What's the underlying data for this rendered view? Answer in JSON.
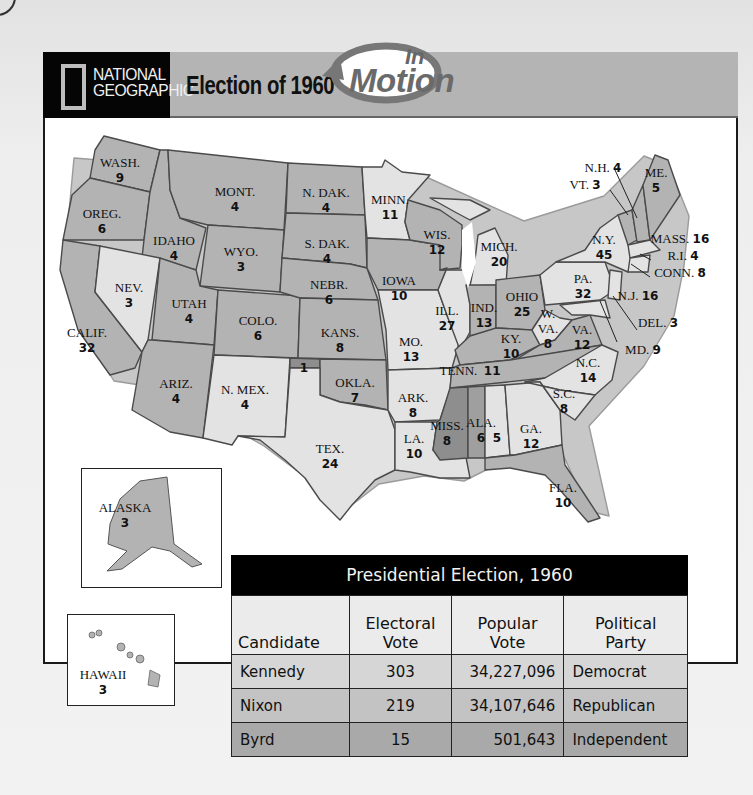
{
  "header": {
    "brand_line1": "NATIONAL",
    "brand_line2": "GEOGRAPHIC",
    "title": "Election of 1960",
    "badge_small": "In",
    "badge_large": "Motion"
  },
  "map": {
    "legend_colors": {
      "kennedy_democrat": "#e3e3e3",
      "nixon_republican": "#b3b3b3",
      "byrd_independent": "#8e8e8e",
      "split_kennedy": "#b7b7b7"
    },
    "states": [
      {
        "abbr": "WASH.",
        "votes": "9"
      },
      {
        "abbr": "OREG.",
        "votes": "6"
      },
      {
        "abbr": "CALIF.",
        "votes": "32"
      },
      {
        "abbr": "IDAHO",
        "votes": "4"
      },
      {
        "abbr": "NEV.",
        "votes": "3"
      },
      {
        "abbr": "MONT.",
        "votes": "4"
      },
      {
        "abbr": "WYO.",
        "votes": "3"
      },
      {
        "abbr": "UTAH",
        "votes": "4"
      },
      {
        "abbr": "COLO.",
        "votes": "6"
      },
      {
        "abbr": "ARIZ.",
        "votes": "4"
      },
      {
        "abbr": "N. MEX.",
        "votes": "4"
      },
      {
        "abbr": "N. DAK.",
        "votes": "4"
      },
      {
        "abbr": "S. DAK.",
        "votes": "4"
      },
      {
        "abbr": "NEBR.",
        "votes": "6"
      },
      {
        "abbr": "KANS.",
        "votes": "8"
      },
      {
        "abbr": "OKLA.",
        "votes": "7"
      },
      {
        "abbr": "TEX.",
        "votes": "24"
      },
      {
        "abbr": "MINN.",
        "votes": "11"
      },
      {
        "abbr": "IOWA",
        "votes": "10"
      },
      {
        "abbr": "MO.",
        "votes": "13"
      },
      {
        "abbr": "ARK.",
        "votes": "8"
      },
      {
        "abbr": "LA.",
        "votes": "10"
      },
      {
        "abbr": "WIS.",
        "votes": "12"
      },
      {
        "abbr": "ILL.",
        "votes": "27"
      },
      {
        "abbr": "MICH.",
        "votes": "20"
      },
      {
        "abbr": "IND.",
        "votes": "13"
      },
      {
        "abbr": "OHIO",
        "votes": "25"
      },
      {
        "abbr": "KY.",
        "votes": "10"
      },
      {
        "abbr": "TENN.",
        "votes": "11"
      },
      {
        "abbr": "MISS.",
        "votes": "8"
      },
      {
        "abbr": "ALA.",
        "votes": "6"
      },
      {
        "abbr": "ALA.",
        "votes": "5"
      },
      {
        "abbr": "GA.",
        "votes": "12"
      },
      {
        "abbr": "FLA.",
        "votes": "10"
      },
      {
        "abbr": "S.C.",
        "votes": "8"
      },
      {
        "abbr": "N.C.",
        "votes": "14"
      },
      {
        "abbr": "VA.",
        "votes": "12"
      },
      {
        "abbr": "W. VA.",
        "votes": "8"
      },
      {
        "abbr": "PA.",
        "votes": "32"
      },
      {
        "abbr": "N.Y.",
        "votes": "45"
      },
      {
        "abbr": "VT.",
        "votes": "3"
      },
      {
        "abbr": "N.H.",
        "votes": "4"
      },
      {
        "abbr": "ME.",
        "votes": "5"
      },
      {
        "abbr": "MASS.",
        "votes": "16"
      },
      {
        "abbr": "R.I.",
        "votes": "4"
      },
      {
        "abbr": "CONN.",
        "votes": "8"
      },
      {
        "abbr": "N.J.",
        "votes": "16"
      },
      {
        "abbr": "DEL.",
        "votes": "3"
      },
      {
        "abbr": "MD.",
        "votes": "9"
      },
      {
        "abbr": "ALASKA",
        "votes": "3"
      },
      {
        "abbr": "HAWAII",
        "votes": "3"
      }
    ],
    "okla_byrd_vote": "1"
  },
  "table": {
    "caption": "Presidential Election, 1960",
    "columns": [
      "Candidate",
      "Electoral\nVote",
      "Popular\nVote",
      "Political\nParty"
    ],
    "rows": [
      {
        "candidate": "Kennedy",
        "electoral": "303",
        "popular": "34,227,096",
        "party": "Democrat"
      },
      {
        "candidate": "Nixon",
        "electoral": "219",
        "popular": "34,107,646",
        "party": "Republican"
      },
      {
        "candidate": "Byrd",
        "electoral": "15",
        "popular": "501,643",
        "party": "Independent"
      }
    ]
  }
}
